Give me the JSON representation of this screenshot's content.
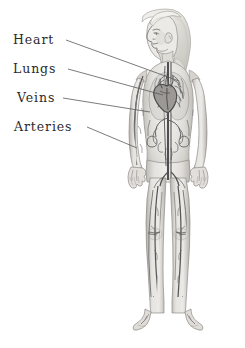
{
  "image": {
    "kind": "anatomical-illustration",
    "subject": "human circulatory system",
    "background_color": "#ffffff",
    "width": 245,
    "height": 348
  },
  "labels": [
    {
      "id": "heart",
      "text": "Heart",
      "x": 13,
      "y": 34,
      "target": "heart-region"
    },
    {
      "id": "lungs",
      "text": "Lungs",
      "x": 13,
      "y": 63,
      "target": "lungs-region"
    },
    {
      "id": "veins",
      "text": "Veins",
      "x": 17,
      "y": 92,
      "target": "veins-region"
    },
    {
      "id": "arteries",
      "text": "Arteries",
      "x": 14,
      "y": 121,
      "target": "arteries-region"
    }
  ],
  "leader_lines": [
    {
      "id": "leader-heart",
      "x1": 66,
      "y1": 40,
      "x2": 179,
      "y2": 81
    },
    {
      "id": "leader-lungs",
      "x1": 68,
      "y1": 69,
      "x2": 163,
      "y2": 95
    },
    {
      "id": "leader-veins",
      "x1": 63,
      "y1": 98,
      "x2": 150,
      "y2": 112
    },
    {
      "id": "leader-arteries",
      "x1": 87,
      "y1": 127,
      "x2": 137,
      "y2": 148
    }
  ],
  "style": {
    "text_color": "#2b2b2b",
    "leader_line_color": "#595959",
    "skin_light": "#f0efed",
    "skin_mid": "#d9d7d3",
    "skin_shadow": "#b8b5b0",
    "hair_light": "#efeeea",
    "hair_shadow": "#c9c6c0",
    "vessel_dark": "#5a5a5a",
    "vessel_mid": "#7d7d7d",
    "outline": "#8c8a86"
  },
  "figure": {
    "pose": "standing, frontal body, head in left profile, arms at sides",
    "parts": [
      "head",
      "hair",
      "neck",
      "torso",
      "right-arm",
      "left-arm",
      "pelvis",
      "right-leg",
      "left-leg",
      "right-foot",
      "left-foot"
    ]
  }
}
